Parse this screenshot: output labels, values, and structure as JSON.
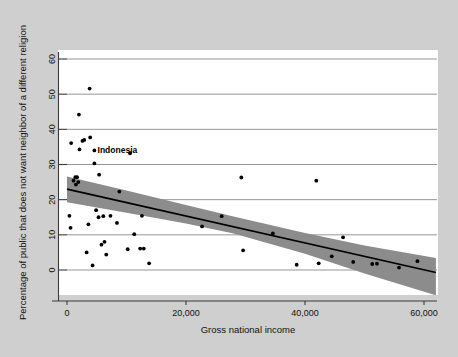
{
  "figure": {
    "background_color": "#cfcfcf",
    "plot_background_color": "#ffffff",
    "gridline_color": "#8a8a8a",
    "band_color": "#8c8c8c",
    "marker_color": "#000000",
    "fit_line_color": "#000000"
  },
  "chart_data": {
    "type": "scatter",
    "title": "",
    "subtitle": "",
    "xlabel": "Gross national income",
    "ylabel": "Percentage of public that does not want neighbor of a different religion",
    "xlim": [
      0,
      62000
    ],
    "ylim": [
      -8,
      62
    ],
    "xticks": [
      0,
      20000,
      40000,
      60000
    ],
    "xticklabels": [
      "0",
      "20,000",
      "40,000",
      "60,000"
    ],
    "yticks": [
      0,
      10,
      20,
      30,
      40,
      50,
      60
    ],
    "yticklabels": [
      "0",
      "10",
      "20",
      "30",
      "40",
      "50",
      "60"
    ],
    "grid": "horizontal",
    "legend": "none",
    "points": [
      {
        "x": 400,
        "y": 15.4
      },
      {
        "x": 600,
        "y": 12.0
      },
      {
        "x": 700,
        "y": 36.1
      },
      {
        "x": 1100,
        "y": 25.4
      },
      {
        "x": 1400,
        "y": 26.4
      },
      {
        "x": 1500,
        "y": 24.3
      },
      {
        "x": 1700,
        "y": 26.4
      },
      {
        "x": 1900,
        "y": 25.0
      },
      {
        "x": 2000,
        "y": 44.2
      },
      {
        "x": 2100,
        "y": 34.3
      },
      {
        "x": 2600,
        "y": 36.7
      },
      {
        "x": 2900,
        "y": 37.0
      },
      {
        "x": 3300,
        "y": 5.0
      },
      {
        "x": 3600,
        "y": 13.0
      },
      {
        "x": 3800,
        "y": 51.6
      },
      {
        "x": 3900,
        "y": 37.7
      },
      {
        "x": 4300,
        "y": 1.3
      },
      {
        "x": 4600,
        "y": 30.3
      },
      {
        "x": 4900,
        "y": 17.0
      },
      {
        "x": 5300,
        "y": 15.0
      },
      {
        "x": 5400,
        "y": 27.1
      },
      {
        "x": 5800,
        "y": 7.2
      },
      {
        "x": 6100,
        "y": 15.3
      },
      {
        "x": 6300,
        "y": 8.0
      },
      {
        "x": 6600,
        "y": 4.4
      },
      {
        "x": 7300,
        "y": 15.4
      },
      {
        "x": 8400,
        "y": 13.4
      },
      {
        "x": 8800,
        "y": 22.3
      },
      {
        "x": 10200,
        "y": 5.9
      },
      {
        "x": 10600,
        "y": 33.2
      },
      {
        "x": 11300,
        "y": 10.2
      },
      {
        "x": 12300,
        "y": 6.1
      },
      {
        "x": 12900,
        "y": 6.1
      },
      {
        "x": 12600,
        "y": 15.4
      },
      {
        "x": 13800,
        "y": 1.9
      },
      {
        "x": 22700,
        "y": 12.4
      },
      {
        "x": 26000,
        "y": 15.3
      },
      {
        "x": 29300,
        "y": 26.3
      },
      {
        "x": 29600,
        "y": 5.6
      },
      {
        "x": 34600,
        "y": 10.4
      },
      {
        "x": 38600,
        "y": 1.5
      },
      {
        "x": 41900,
        "y": 25.4
      },
      {
        "x": 42300,
        "y": 1.9
      },
      {
        "x": 44500,
        "y": 3.9
      },
      {
        "x": 46400,
        "y": 9.3
      },
      {
        "x": 48100,
        "y": 2.3
      },
      {
        "x": 51300,
        "y": 1.7
      },
      {
        "x": 52100,
        "y": 1.8
      },
      {
        "x": 55800,
        "y": 0.7
      },
      {
        "x": 58900,
        "y": 2.5
      }
    ],
    "annotations": [
      {
        "label": "Indonesia",
        "x": 4600,
        "y": 34.0
      }
    ],
    "fit_line": {
      "x_start": 0,
      "y_start": 23.0,
      "x_end": 62000,
      "y_end": -0.7
    },
    "confidence_band": {
      "upper": [
        {
          "x": 0,
          "y": 26.6
        },
        {
          "x": 10000,
          "y": 22.6
        },
        {
          "x": 20000,
          "y": 18.5
        },
        {
          "x": 28000,
          "y": 15.2
        },
        {
          "x": 40000,
          "y": 10.5
        },
        {
          "x": 50000,
          "y": 7.0
        },
        {
          "x": 62000,
          "y": 3.4
        }
      ],
      "lower": [
        {
          "x": 0,
          "y": 19.3
        },
        {
          "x": 10000,
          "y": 16.3
        },
        {
          "x": 20000,
          "y": 13.2
        },
        {
          "x": 28000,
          "y": 10.4
        },
        {
          "x": 40000,
          "y": 4.6
        },
        {
          "x": 50000,
          "y": -1.0
        },
        {
          "x": 62000,
          "y": -7.2
        }
      ]
    }
  }
}
